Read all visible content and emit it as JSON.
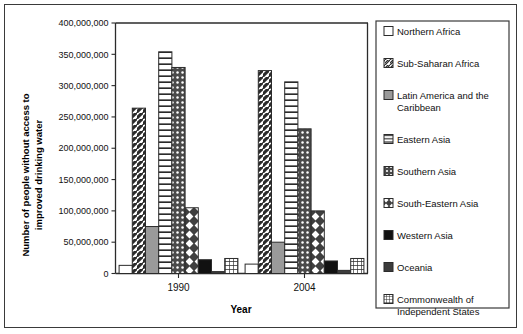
{
  "chart_data": {
    "type": "bar",
    "title": "",
    "xlabel": "Year",
    "ylabel": "Number of people without access to improved drinking water",
    "categories": [
      "1990",
      "2004"
    ],
    "ylim": [
      0,
      400000000
    ],
    "ytick_values": [
      0,
      50000000,
      100000000,
      150000000,
      200000000,
      250000000,
      300000000,
      350000000,
      400000000
    ],
    "ytick_labels": [
      "0",
      "50,000,000",
      "100,000,000",
      "150,000,000",
      "200,000,000",
      "250,000,000",
      "300,000,000",
      "350,000,000",
      "400,000,000"
    ],
    "grid": false,
    "legend_position": "right",
    "series": [
      {
        "name": "Northern Africa",
        "pattern": "solid-white",
        "values": [
          13000000,
          15000000
        ]
      },
      {
        "name": "Sub-Saharan Africa",
        "pattern": "diagonal",
        "values": [
          264000000,
          324000000
        ]
      },
      {
        "name": "Latin America and the Caribbean",
        "pattern": "solid-gray",
        "values": [
          75000000,
          50000000
        ]
      },
      {
        "name": "Eastern Asia",
        "pattern": "horizontal",
        "values": [
          354000000,
          306000000
        ]
      },
      {
        "name": "Southern Asia",
        "pattern": "fine-grid",
        "values": [
          329000000,
          231000000
        ]
      },
      {
        "name": "South-Eastern Asia",
        "pattern": "diamond",
        "values": [
          105000000,
          100000000
        ]
      },
      {
        "name": "Western Asia",
        "pattern": "solid-black",
        "values": [
          22000000,
          20000000
        ]
      },
      {
        "name": "Oceania",
        "pattern": "solid-dark",
        "values": [
          3000000,
          5000000
        ]
      },
      {
        "name": "Commonwealth of Independent States",
        "pattern": "cross-grid",
        "values": [
          24000000,
          24000000
        ]
      }
    ]
  },
  "legend": {
    "items": [
      {
        "label": "Northern Africa"
      },
      {
        "label": "Sub-Saharan Africa"
      },
      {
        "label": "Latin America and the",
        "label2": "Caribbean"
      },
      {
        "label": "Eastern Asia"
      },
      {
        "label": "Southern Asia"
      },
      {
        "label": "South-Eastern Asia"
      },
      {
        "label": "Western Asia"
      },
      {
        "label": "Oceania"
      },
      {
        "label": "Commonwealth of",
        "label2": "Independent States"
      }
    ]
  },
  "axes": {
    "y_title_line1": "Number of people without access to",
    "y_title_line2": "improved drinking water",
    "x_title": "Year"
  },
  "colors": {
    "ink": "#2b2b2b",
    "gray_fill": "#9a9a9a",
    "dark_fill": "#3c3c3c",
    "black_fill": "#111111",
    "white_fill": "#ffffff"
  }
}
